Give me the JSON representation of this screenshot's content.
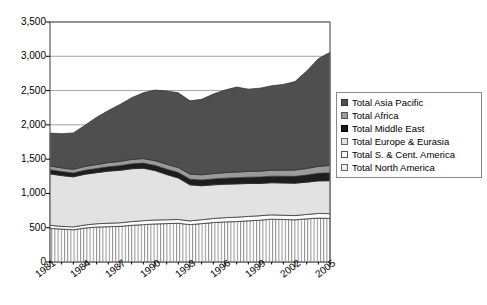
{
  "chart_data": {
    "type": "area",
    "stacked": true,
    "title": "",
    "subtitle": "",
    "xlabel": "",
    "ylabel": "",
    "grid": true,
    "legend_position": "right",
    "xlim": [
      1981,
      2005
    ],
    "ylim": [
      0,
      3500
    ],
    "ytick_step": 500,
    "x": [
      1981,
      1982,
      1983,
      1984,
      1985,
      1986,
      1987,
      1988,
      1989,
      1990,
      1991,
      1992,
      1993,
      1994,
      1995,
      1996,
      1997,
      1998,
      1999,
      2000,
      2001,
      2002,
      2003,
      2004,
      2005
    ],
    "xtick_labels": [
      "1981",
      "1984",
      "1987",
      "1990",
      "1993",
      "1996",
      "1999",
      "2002",
      "2005"
    ],
    "ytick_labels": [
      "0",
      "500",
      "1,000",
      "1,500",
      "2,000",
      "2,500",
      "3,000",
      "3,500"
    ],
    "series": [
      {
        "name": "Total North America",
        "color": "#efefef",
        "pattern": "vertical-lines",
        "values": [
          490,
          480,
          470,
          495,
          510,
          515,
          520,
          535,
          545,
          555,
          560,
          565,
          545,
          560,
          575,
          585,
          590,
          600,
          610,
          625,
          620,
          615,
          630,
          640,
          635
        ]
      },
      {
        "name": "Total S. & Cent. America",
        "color": "#fbfbfb",
        "pattern": "solid",
        "values": [
          45,
          40,
          42,
          45,
          48,
          50,
          52,
          55,
          58,
          58,
          56,
          55,
          55,
          57,
          60,
          62,
          64,
          65,
          65,
          63,
          62,
          62,
          64,
          68,
          70
        ]
      },
      {
        "name": "Total Europe & Eurasia",
        "color": "#e2e2e2",
        "pattern": "solid",
        "values": [
          750,
          740,
          730,
          740,
          745,
          760,
          765,
          770,
          765,
          720,
          660,
          605,
          525,
          495,
          490,
          488,
          485,
          480,
          470,
          468,
          470,
          472,
          470,
          475,
          480
        ]
      },
      {
        "name": "Total Middle East",
        "color": "#1d1d1d",
        "pattern": "solid",
        "values": [
          60,
          58,
          56,
          58,
          60,
          64,
          68,
          72,
          74,
          76,
          78,
          80,
          82,
          84,
          86,
          88,
          90,
          92,
          94,
          96,
          98,
          100,
          104,
          110,
          115
        ]
      },
      {
        "name": "Total Africa",
        "color": "#9a9a9a",
        "pattern": "solid",
        "values": [
          55,
          54,
          54,
          56,
          58,
          60,
          62,
          64,
          66,
          68,
          70,
          72,
          74,
          76,
          78,
          80,
          82,
          84,
          86,
          88,
          90,
          92,
          96,
          102,
          108
        ]
      },
      {
        "name": "Total Asia Pacific",
        "color": "#4f4f4f",
        "pattern": "solid",
        "values": [
          480,
          500,
          530,
          600,
          690,
          760,
          830,
          900,
          960,
          1030,
          1070,
          1090,
          1070,
          1100,
          1160,
          1205,
          1240,
          1200,
          1210,
          1230,
          1250,
          1290,
          1420,
          1570,
          1650
        ]
      }
    ],
    "totals": [
      1880,
      1872,
      1882,
      1994,
      2111,
      2209,
      2297,
      2396,
      2468,
      2507,
      2494,
      2467,
      2351,
      2372,
      2449,
      2508,
      2551,
      2521,
      2535,
      2570,
      2590,
      2633,
      2784,
      2965,
      3058
    ]
  },
  "legend": {
    "items": [
      {
        "label": "Total Asia Pacific",
        "swatch": "sw-asia"
      },
      {
        "label": "Total Africa",
        "swatch": "sw-africa"
      },
      {
        "label": "Total Middle East",
        "swatch": "sw-me"
      },
      {
        "label": "Total Europe & Eurasia",
        "swatch": "sw-eur"
      },
      {
        "label": "Total S. & Cent. America",
        "swatch": "sw-sca"
      },
      {
        "label": "Total North America",
        "swatch": "sw-na"
      }
    ]
  }
}
